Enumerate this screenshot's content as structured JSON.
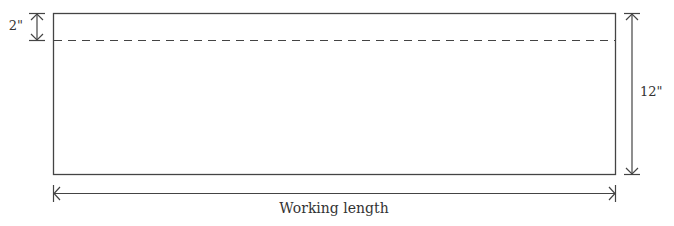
{
  "diagram": {
    "top_dimension_label": "2\"",
    "side_dimension_label": "12\"",
    "bottom_dimension_label": "Working length",
    "colors": {
      "line": "#444444",
      "text": "#333333",
      "background": "#ffffff"
    }
  }
}
